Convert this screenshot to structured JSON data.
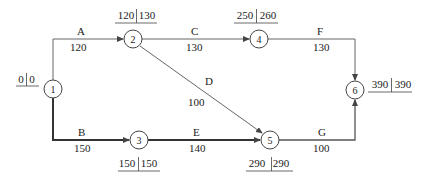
{
  "diagram": {
    "type": "activity-on-arrow network",
    "nodes": [
      {
        "id": "1",
        "label": "1",
        "earliest": "0",
        "latest": "0",
        "x": 53,
        "y": 89
      },
      {
        "id": "2",
        "label": "2",
        "earliest": "120",
        "latest": "130",
        "x": 133,
        "y": 39
      },
      {
        "id": "3",
        "label": "3",
        "earliest": "150",
        "latest": "150",
        "x": 139,
        "y": 140
      },
      {
        "id": "4",
        "label": "4",
        "earliest": "250",
        "latest": "260",
        "x": 259,
        "y": 39
      },
      {
        "id": "5",
        "label": "5",
        "earliest": "290",
        "latest": "290",
        "x": 270,
        "y": 140
      },
      {
        "id": "6",
        "label": "6",
        "earliest": "390",
        "latest": "390",
        "x": 355,
        "y": 90
      }
    ],
    "activities": [
      {
        "name": "A",
        "duration": "120",
        "from": "1",
        "to": "2",
        "critical": false
      },
      {
        "name": "B",
        "duration": "150",
        "from": "1",
        "to": "3",
        "critical": true
      },
      {
        "name": "C",
        "duration": "130",
        "from": "2",
        "to": "4",
        "critical": false
      },
      {
        "name": "D",
        "duration": "100",
        "from": "2",
        "to": "5",
        "critical": false
      },
      {
        "name": "E",
        "duration": "140",
        "from": "3",
        "to": "5",
        "critical": true
      },
      {
        "name": "F",
        "duration": "130",
        "from": "4",
        "to": "6",
        "critical": false
      },
      {
        "name": "G",
        "duration": "100",
        "from": "5",
        "to": "6",
        "critical": true
      }
    ],
    "colors": {
      "line": "#555555",
      "critical_line": "#333333",
      "text": "#222222"
    }
  }
}
